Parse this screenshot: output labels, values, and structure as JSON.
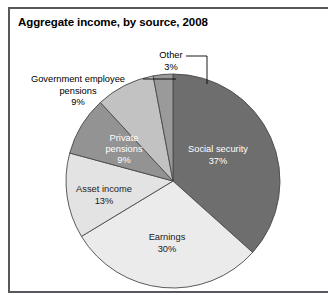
{
  "figure": {
    "title": "Aggregate income, by source, 2008",
    "frame_color": "#55585c",
    "background": "#ffffff"
  },
  "chart_data": {
    "type": "pie",
    "title": "Aggregate income, by source, 2008",
    "xlabel": "",
    "ylabel": "",
    "units": "percent",
    "total": 101,
    "start_angle_deg": 0,
    "direction": "clockwise",
    "categories": [
      "Social security",
      "Earnings",
      "Asset income",
      "Private pensions",
      "Government employee pensions",
      "Other"
    ],
    "values": [
      37,
      30,
      13,
      9,
      9,
      3
    ],
    "slices": [
      {
        "name": "Social security",
        "value": 37,
        "value_label": "37%",
        "color": "#6e6e6e",
        "label_placement": "inside",
        "label_color": "#ffffff",
        "label_text": "Social security",
        "label_x": 218,
        "label_y": 152
      },
      {
        "name": "Earnings",
        "value": 30,
        "value_label": "30%",
        "color": "#ebebeb",
        "label_placement": "inside",
        "label_color": "#1a1a1a",
        "label_text": "Earnings",
        "label_x": 167,
        "label_y": 240
      },
      {
        "name": "Asset income",
        "value": 13,
        "value_label": "13%",
        "color": "#e3e3e3",
        "label_placement": "inside",
        "label_color": "#1a1a1a",
        "label_text": "Asset income",
        "label_x": 104,
        "label_y": 192
      },
      {
        "name": "Private pensions",
        "value": 9,
        "value_label": "9%",
        "color": "#939393",
        "label_placement": "inside",
        "label_color": "#ffffff",
        "label_text": "Private pensions",
        "label_x": 124,
        "label_y": 141
      },
      {
        "name": "Government employee pensions",
        "value": 9,
        "value_label": "9%",
        "color": "#c2c2c2",
        "label_placement": "outside",
        "label_color": "#000000",
        "label_text": "Government employee pensions",
        "leader": {
          "x1": 143,
          "y1": 79,
          "x2": 176,
          "y2": 79
        }
      },
      {
        "name": "Other",
        "value": 3,
        "value_label": "3%",
        "color": "#9a9a9a",
        "label_placement": "outside",
        "label_color": "#000000",
        "label_text": "Other",
        "leader": {
          "x1": 186,
          "y1": 56,
          "x2": 207,
          "y2": 56,
          "x3": 207,
          "y3": 84
        }
      }
    ],
    "geometry": {
      "cx": 173,
      "cy": 181,
      "r": 107
    },
    "legend": "none",
    "grid": false
  },
  "labels": {
    "other": "Other\n3%",
    "government_pensions": "Government employee\npensions\n9%"
  }
}
